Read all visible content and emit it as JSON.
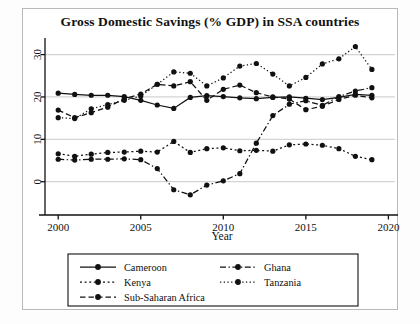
{
  "chart_data": {
    "type": "line",
    "title": "Gross Domestic Savings (% GDP) in SSA countries",
    "xlabel": "Year",
    "ylabel": "",
    "xlim": [
      1999.2,
      2020.4
    ],
    "ylim": [
      -5.5,
      32.5
    ],
    "xticks": [
      2000,
      2005,
      2010,
      2015,
      2020
    ],
    "yticks": [
      0,
      10,
      20,
      30
    ],
    "grid": "horizontal",
    "legend_position": "bottom",
    "x": [
      2000,
      2001,
      2002,
      2003,
      2004,
      2005,
      2006,
      2007,
      2008,
      2009,
      2010,
      2011,
      2012,
      2013,
      2014,
      2015,
      2016,
      2017,
      2018,
      2019
    ],
    "series": [
      {
        "name": "Cameroon",
        "style": "solid",
        "values": [
          20.9,
          20.6,
          20.4,
          20.4,
          20.1,
          19.2,
          18.1,
          17.3,
          19.9,
          20.3,
          20.1,
          19.8,
          19.6,
          19.9,
          20.0,
          19.7,
          19.4,
          19.9,
          20.6,
          20.4
        ]
      },
      {
        "name": "Kenya",
        "style": "dotted",
        "values": [
          6.6,
          6.0,
          6.5,
          6.9,
          7.0,
          7.2,
          7.0,
          9.5,
          6.9,
          7.8,
          8.0,
          7.3,
          7.4,
          7.2,
          8.7,
          8.9,
          8.6,
          7.8,
          6.0,
          5.2
        ]
      },
      {
        "name": "Sub-Saharan Africa",
        "style": "dashed",
        "values": [
          16.9,
          15.1,
          16.3,
          17.6,
          19.6,
          20.7,
          23.0,
          22.6,
          23.6,
          19.2,
          21.8,
          22.8,
          21.0,
          20.0,
          19.5,
          17.0,
          17.8,
          19.4,
          20.4,
          19.8
        ]
      },
      {
        "name": "Ghana",
        "style": "dashdot",
        "values": [
          5.3,
          5.1,
          5.3,
          5.3,
          5.4,
          5.2,
          3.1,
          -1.9,
          -3.1,
          -0.8,
          0.2,
          1.9,
          9.1,
          15.6,
          18.3,
          19.1,
          18.0,
          20.1,
          21.4,
          22.2
        ]
      },
      {
        "name": "Tanzania",
        "style": "fine-dotted",
        "values": [
          15.1,
          14.9,
          17.2,
          18.2,
          19.2,
          20.2,
          23.0,
          25.9,
          25.6,
          22.6,
          24.5,
          27.3,
          27.9,
          25.4,
          22.6,
          24.6,
          27.8,
          29.0,
          31.9,
          26.5
        ]
      }
    ]
  },
  "axis": {
    "x_title": "Year",
    "x_tick_labels": [
      "2000",
      "2005",
      "2010",
      "2015",
      "2020"
    ],
    "y_tick_labels": [
      "0",
      "10",
      "20",
      "30"
    ]
  },
  "legend": {
    "entries": [
      {
        "label": "Cameroon",
        "style": "solid"
      },
      {
        "label": "Ghana",
        "style": "dashdot"
      },
      {
        "label": "Kenya",
        "style": "dotted"
      },
      {
        "label": "Tanzania",
        "style": "fine-dotted"
      },
      {
        "label": "Sub-Saharan Africa",
        "style": "dashed"
      }
    ]
  },
  "colors": {
    "ink": "#111111",
    "grid": "#d4d4d4",
    "frame": "#b9b9b9",
    "background": "#ffffff"
  }
}
